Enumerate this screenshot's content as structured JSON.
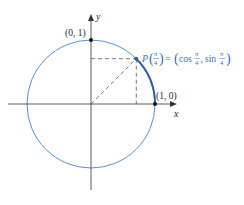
{
  "diagram": {
    "type": "unit-circle",
    "colors": {
      "circle": "#5b8fd0",
      "arc": "#2f5fa8",
      "axis": "#333333",
      "dashed": "#555555",
      "point_label": "#3a6fb8",
      "text": "#2a2a2a"
    },
    "axes": {
      "x_label": "x",
      "y_label": "y"
    },
    "points": {
      "top": {
        "label": "(0, 1)"
      },
      "right": {
        "label": "(1, 0)"
      },
      "p": {
        "name": "P",
        "arg_num": "π",
        "arg_den": "4",
        "equals": "=",
        "cos_fn": "cos",
        "sin_fn": "sin",
        "frac_num": "π",
        "frac_den": "4",
        "comma": ","
      }
    }
  }
}
